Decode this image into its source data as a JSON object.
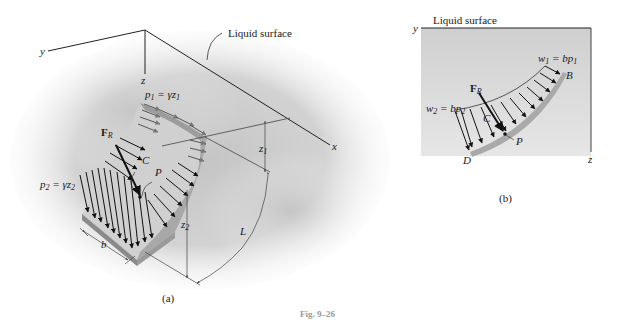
{
  "figure": {
    "caption": "Fig. 9–26",
    "panels": [
      {
        "id": "a",
        "label": "(a)",
        "axes": {
          "x": "x",
          "y": "y",
          "z": "z"
        },
        "callout": "Liquid surface",
        "labels": {
          "p1": "p",
          "p1_sub": "1",
          "p1_eq": " = γz",
          "p1_eq_sub": "1",
          "p2": "p",
          "p2_sub": "2",
          "p2_eq": " = γz",
          "p2_eq_sub": "2",
          "FR": "F",
          "FR_sub": "R",
          "C": "C",
          "P": "P",
          "z1": "z",
          "z1_sub": "1",
          "z2": "z",
          "z2_sub": "2",
          "b": "b",
          "L": "L"
        }
      },
      {
        "id": "b",
        "label": "(b)",
        "axes": {
          "y": "y",
          "z": "z"
        },
        "callout": "Liquid surface",
        "labels": {
          "w1": "w",
          "w1_sub": "1",
          "w1_eq": " = bp",
          "w1_eq_sub": "1",
          "w2": "w",
          "w2_sub": "2",
          "w2_eq": " = bp",
          "w2_eq_sub": "2",
          "FR": "F",
          "FR_sub": "R",
          "C": "C",
          "P": "P",
          "B": "B",
          "D": "D"
        }
      }
    ]
  },
  "colors": {
    "liquid_shade": "#c9c9c9",
    "plate": "#b0b0b0",
    "plate_face": "#d4d4d4",
    "line": "#222222",
    "arrow": "#111111",
    "caption_gray": "#999999"
  }
}
